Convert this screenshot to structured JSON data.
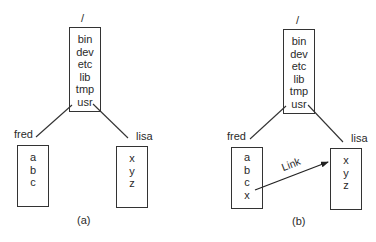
{
  "diagram": {
    "panels": [
      {
        "id": "a",
        "caption": "(a)",
        "root": {
          "label": "/",
          "entries": [
            "bin",
            "dev",
            "etc",
            "lib",
            "tmp",
            "usr"
          ]
        },
        "children": [
          {
            "name": "fred",
            "entries": [
              "a",
              "b",
              "c"
            ]
          },
          {
            "name": "lisa",
            "entries": [
              "x",
              "y",
              "z"
            ]
          }
        ]
      },
      {
        "id": "b",
        "caption": "(b)",
        "root": {
          "label": "/",
          "entries": [
            "bin",
            "dev",
            "etc",
            "lib",
            "tmp",
            "usr"
          ]
        },
        "children": [
          {
            "name": "fred",
            "entries": [
              "a",
              "b",
              "c",
              "x"
            ]
          },
          {
            "name": "lisa",
            "entries": [
              "x",
              "y",
              "z"
            ]
          }
        ],
        "link": {
          "label": "Link",
          "from": "fred/x",
          "to": "lisa"
        }
      }
    ]
  }
}
